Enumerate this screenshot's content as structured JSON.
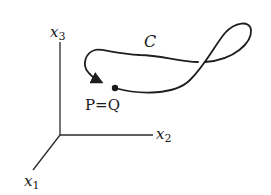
{
  "diagram": {
    "axes": {
      "x1": {
        "label": "x",
        "subscript": "1"
      },
      "x2": {
        "label": "x",
        "subscript": "2"
      },
      "x3": {
        "label": "x",
        "subscript": "3"
      }
    },
    "curve": {
      "label": "C",
      "description": "closed curve with a figure-eight style crossing and arrowhead indicating direction"
    },
    "point": {
      "label": "P=Q"
    },
    "colors": {
      "stroke": "#1e1e1e",
      "background": "#ffffff"
    }
  }
}
